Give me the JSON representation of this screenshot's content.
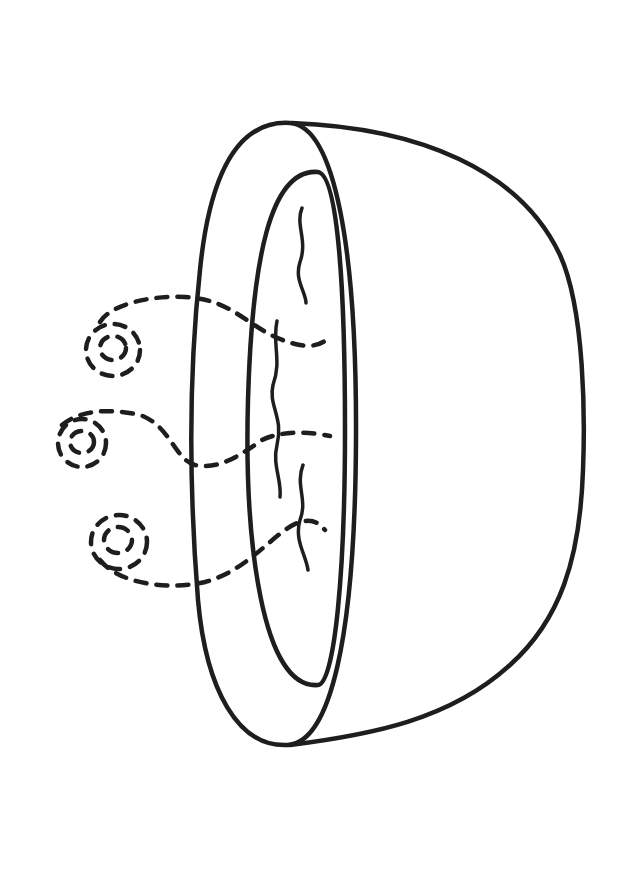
{
  "image": {
    "subject": "Line drawing of a steaming bowl of soup (rotated 90°)",
    "style": "black outline coloring-page illustration",
    "colors": {
      "background": "#ffffff",
      "ink": "#1e1e1e"
    },
    "elements": [
      "bowl-outer-rim",
      "bowl-inner-rim",
      "bowl-body",
      "soup-ripples",
      "steam-swirls"
    ]
  }
}
